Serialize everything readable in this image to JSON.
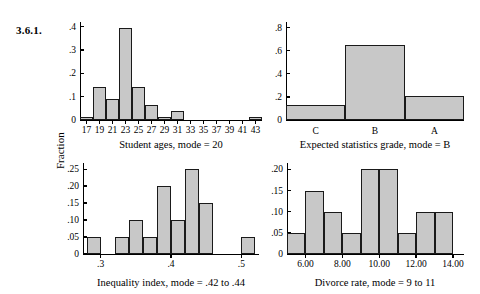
{
  "figure": {
    "number": "3.6.1.",
    "shared_y_axis_label": "Fraction",
    "bar_fill_color": "#c8c8c8",
    "bar_edge_color": "#1a1a1a"
  },
  "chart_data": [
    {
      "id": "student-ages",
      "type": "bar",
      "title": "",
      "caption": "Student ages, mode = 20",
      "xlabel": "Student ages, mode = 20",
      "ylabel": "Fraction",
      "ylim": [
        0,
        0.42
      ],
      "yticks": [
        0,
        0.1,
        0.2,
        0.3,
        0.4
      ],
      "ytick_labels": [
        "0",
        ".1",
        ".2",
        ".3",
        ".4"
      ],
      "xlim": [
        16,
        44
      ],
      "xticks": [
        17,
        19,
        21,
        23,
        25,
        27,
        29,
        31,
        33,
        35,
        37,
        39,
        41,
        43
      ],
      "xtick_labels": [
        "17",
        "19",
        "21",
        "23",
        "25",
        "27",
        "29",
        "31",
        "33",
        "35",
        "37",
        "39",
        "41",
        "43"
      ],
      "grid": false,
      "bin_width": 2,
      "bin_starts": [
        16,
        18,
        20,
        22,
        24,
        26,
        28,
        30,
        42
      ],
      "values": [
        0.015,
        0.14,
        0.09,
        0.395,
        0.14,
        0.065,
        0.015,
        0.04,
        0.015
      ],
      "bins": [
        {
          "start": 16,
          "end": 18,
          "value": 0.015
        },
        {
          "start": 18,
          "end": 20,
          "value": 0.14
        },
        {
          "start": 20,
          "end": 22,
          "value": 0.09
        },
        {
          "start": 22,
          "end": 24,
          "value": 0.395
        },
        {
          "start": 24,
          "end": 26,
          "value": 0.14
        },
        {
          "start": 26,
          "end": 28,
          "value": 0.065
        },
        {
          "start": 28,
          "end": 30,
          "value": 0.015
        },
        {
          "start": 30,
          "end": 32,
          "value": 0.04
        },
        {
          "start": 42,
          "end": 44,
          "value": 0.015
        }
      ]
    },
    {
      "id": "expected-statistics-grade",
      "type": "bar",
      "title": "",
      "caption": "Expected statistics grade, mode = B",
      "xlabel": "Expected statistics grade, mode = B",
      "ylabel": "Fraction",
      "ylim": [
        0,
        0.85
      ],
      "yticks": [
        0,
        0.2,
        0.4,
        0.6,
        0.8
      ],
      "ytick_labels": [
        "0",
        ".2",
        ".4",
        ".6",
        ".8"
      ],
      "categories": [
        "C",
        "B",
        "A"
      ],
      "values": [
        0.13,
        0.65,
        0.21
      ],
      "grid": false
    },
    {
      "id": "inequality-index",
      "type": "bar",
      "title": "",
      "caption": "Inequality index, mode = .42 to .44",
      "xlabel": "Inequality index, mode = .42 to .44",
      "ylabel": "Fraction",
      "ylim": [
        0,
        0.268
      ],
      "yticks": [
        0,
        0.05,
        0.1,
        0.15,
        0.2,
        0.25
      ],
      "ytick_labels": [
        "0",
        ".05",
        ".10",
        ".15",
        ".20",
        ".25"
      ],
      "xlim": [
        0.275,
        0.525
      ],
      "xticks": [
        0.3,
        0.4,
        0.5
      ],
      "xtick_labels": [
        ".3",
        ".4",
        ".5"
      ],
      "grid": false,
      "bin_width": 0.02,
      "bins": [
        {
          "start": 0.28,
          "end": 0.3,
          "value": 0.05
        },
        {
          "start": 0.32,
          "end": 0.34,
          "value": 0.05
        },
        {
          "start": 0.34,
          "end": 0.36,
          "value": 0.1
        },
        {
          "start": 0.36,
          "end": 0.38,
          "value": 0.05
        },
        {
          "start": 0.38,
          "end": 0.4,
          "value": 0.2
        },
        {
          "start": 0.4,
          "end": 0.42,
          "value": 0.1
        },
        {
          "start": 0.42,
          "end": 0.44,
          "value": 0.25
        },
        {
          "start": 0.44,
          "end": 0.46,
          "value": 0.15
        },
        {
          "start": 0.5,
          "end": 0.52,
          "value": 0.05
        }
      ],
      "values": [
        0.05,
        0.05,
        0.1,
        0.05,
        0.2,
        0.1,
        0.25,
        0.15,
        0.05
      ]
    },
    {
      "id": "divorce-rate",
      "type": "bar",
      "title": "",
      "caption": "Divorce rate, mode = 9 to 11",
      "xlabel": "Divorce rate, mode = 9 to 11",
      "ylabel": "Fraction",
      "ylim": [
        0,
        0.215
      ],
      "yticks": [
        0,
        0.05,
        0.1,
        0.15,
        0.2
      ],
      "ytick_labels": [
        "0",
        ".05",
        ".10",
        ".15",
        ".20"
      ],
      "xlim": [
        5.0,
        14.6
      ],
      "xticks": [
        6.0,
        8.0,
        10.0,
        12.0,
        14.0
      ],
      "xtick_labels": [
        "6.00",
        "8.00",
        "10.00",
        "12.00",
        "14.00"
      ],
      "grid": false,
      "bin_width": 1,
      "bins": [
        {
          "start": 5,
          "end": 6,
          "value": 0.05
        },
        {
          "start": 6,
          "end": 7,
          "value": 0.15
        },
        {
          "start": 7,
          "end": 8,
          "value": 0.1
        },
        {
          "start": 8,
          "end": 9,
          "value": 0.05
        },
        {
          "start": 9,
          "end": 10,
          "value": 0.2
        },
        {
          "start": 10,
          "end": 11,
          "value": 0.2
        },
        {
          "start": 11,
          "end": 12,
          "value": 0.05
        },
        {
          "start": 12,
          "end": 13,
          "value": 0.1
        },
        {
          "start": 13,
          "end": 14,
          "value": 0.1
        }
      ],
      "values": [
        0.05,
        0.15,
        0.1,
        0.05,
        0.2,
        0.2,
        0.05,
        0.1,
        0.1
      ]
    }
  ]
}
